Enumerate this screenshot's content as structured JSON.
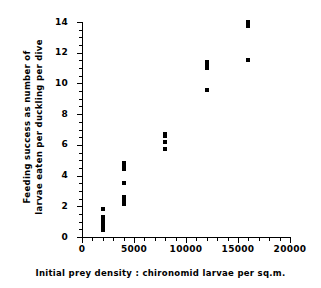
{
  "chart_data": {
    "type": "scatter",
    "title": "",
    "xlabel": "Initial prey density : chironomid larvae per sq.m.",
    "ylabel": "Feeding success as number of larvae eaten per duckling per dive",
    "ylabel_line1": "Feeding success as number of",
    "ylabel_line2": "larvae eaten per duckling per dive",
    "xlim": [
      0,
      20000
    ],
    "ylim": [
      0,
      14
    ],
    "x_major_ticks": [
      0,
      5000,
      10000,
      15000,
      20000
    ],
    "x_tick_labels": [
      "0",
      "5000",
      "10000",
      "15000",
      "20000"
    ],
    "x_minor_interval": 1000,
    "y_major_ticks": [
      0,
      2,
      4,
      6,
      8,
      10,
      12,
      14
    ],
    "y_tick_labels": [
      "0",
      "2",
      "4",
      "6",
      "8",
      "10",
      "12",
      "14"
    ],
    "y_minor_interval": 0.5,
    "grid": false,
    "legend": false,
    "marker": "square",
    "marker_color": "#000000",
    "points": [
      {
        "x": 2000,
        "y": 0.45
      },
      {
        "x": 2000,
        "y": 0.6
      },
      {
        "x": 2000,
        "y": 0.75
      },
      {
        "x": 2000,
        "y": 0.9
      },
      {
        "x": 2000,
        "y": 1.0
      },
      {
        "x": 2000,
        "y": 1.1
      },
      {
        "x": 2000,
        "y": 1.2
      },
      {
        "x": 2000,
        "y": 1.3
      },
      {
        "x": 2000,
        "y": 1.8
      },
      {
        "x": 4000,
        "y": 2.15
      },
      {
        "x": 4000,
        "y": 2.3
      },
      {
        "x": 4000,
        "y": 2.45
      },
      {
        "x": 4000,
        "y": 2.6
      },
      {
        "x": 4000,
        "y": 3.5
      },
      {
        "x": 4000,
        "y": 4.4
      },
      {
        "x": 4000,
        "y": 4.55
      },
      {
        "x": 4000,
        "y": 4.8
      },
      {
        "x": 8000,
        "y": 5.7
      },
      {
        "x": 8000,
        "y": 6.2
      },
      {
        "x": 8000,
        "y": 6.55
      },
      {
        "x": 8000,
        "y": 6.7
      },
      {
        "x": 12000,
        "y": 9.6
      },
      {
        "x": 12000,
        "y": 11.0
      },
      {
        "x": 12000,
        "y": 11.15
      },
      {
        "x": 12000,
        "y": 11.4
      },
      {
        "x": 16000,
        "y": 11.5
      },
      {
        "x": 16000,
        "y": 13.75
      },
      {
        "x": 16000,
        "y": 14.0
      }
    ]
  }
}
